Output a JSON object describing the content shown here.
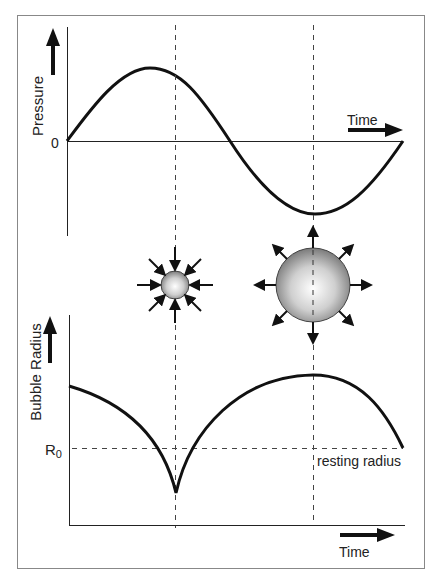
{
  "top_panel": {
    "y_label": "Pressure",
    "zero_label": "0",
    "x_label": "Time"
  },
  "bubbles": {
    "compressed": {
      "description": "small bubble with inward arrows"
    },
    "expanded": {
      "description": "large bubble with outward arrows"
    }
  },
  "bottom_panel": {
    "y_label": "Bubble Radius",
    "r0_label_main": "R",
    "r0_label_sub": "0",
    "resting_label": "resting radius",
    "x_label": "Time"
  },
  "colors": {
    "line": "#111111",
    "frame": "#888888",
    "dash": "#444444",
    "bubble_light": "#ffffff",
    "bubble_dark": "#7a7a7a"
  }
}
